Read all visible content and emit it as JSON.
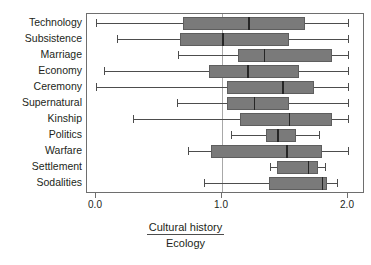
{
  "chart_data": {
    "type": "boxplot",
    "title": "",
    "xlabel_numerator": "Cultural history",
    "xlabel_denominator": "Ecology",
    "ylabel": "",
    "xlim": [
      -0.06,
      2.14
    ],
    "xticks": [
      0.0,
      1.0,
      2.0
    ],
    "xtick_labels": [
      "0.0",
      "1.0",
      "2.0"
    ],
    "grid": false,
    "reference_line": 1.0,
    "legend": "none",
    "orientation": "horizontal",
    "categories": [
      "Technology",
      "Subsistence",
      "Marriage",
      "Economy",
      "Ceremony",
      "Supernatural",
      "Kinship",
      "Politics",
      "Warfare",
      "Settlement",
      "Sodalities"
    ],
    "boxes": [
      {
        "category": "Technology",
        "whisker_low": 0.0,
        "q1": 0.69,
        "median": 1.21,
        "q3": 1.66,
        "whisker_high": 2.0
      },
      {
        "category": "Subsistence",
        "whisker_low": 0.17,
        "q1": 0.67,
        "median": 1.0,
        "q3": 1.53,
        "whisker_high": 2.0
      },
      {
        "category": "Marriage",
        "whisker_low": 0.65,
        "q1": 1.13,
        "median": 1.33,
        "q3": 1.87,
        "whisker_high": 2.0
      },
      {
        "category": "Economy",
        "whisker_low": 0.06,
        "q1": 0.9,
        "median": 1.2,
        "q3": 1.61,
        "whisker_high": 2.0
      },
      {
        "category": "Ceremony",
        "whisker_low": 0.0,
        "q1": 1.04,
        "median": 1.48,
        "q3": 1.73,
        "whisker_high": 2.0
      },
      {
        "category": "Supernatural",
        "whisker_low": 0.64,
        "q1": 1.04,
        "median": 1.25,
        "q3": 1.53,
        "whisker_high": 2.0
      },
      {
        "category": "Kinship",
        "whisker_low": 0.29,
        "q1": 1.14,
        "median": 1.53,
        "q3": 1.87,
        "whisker_high": 2.0
      },
      {
        "category": "Politics",
        "whisker_low": 1.07,
        "q1": 1.35,
        "median": 1.44,
        "q3": 1.59,
        "whisker_high": 1.77
      },
      {
        "category": "Warfare",
        "whisker_low": 0.73,
        "q1": 0.91,
        "median": 1.51,
        "q3": 1.79,
        "whisker_high": 2.0
      },
      {
        "category": "Settlement",
        "whisker_low": 1.38,
        "q1": 1.44,
        "median": 1.68,
        "q3": 1.76,
        "whisker_high": 1.82
      },
      {
        "category": "Sodalities",
        "whisker_low": 0.86,
        "q1": 1.37,
        "median": 1.79,
        "q3": 1.83,
        "whisker_high": 1.91
      }
    ]
  },
  "colors": {
    "box_fill": "#7a7a7a",
    "box_edge": "#5e5e5e",
    "median": "#262626",
    "whisker": "#4d4d4d",
    "frame": "#6e6e6e",
    "reference_line": "#a8a8a8",
    "text": "#231f20",
    "background": "#ffffff"
  }
}
